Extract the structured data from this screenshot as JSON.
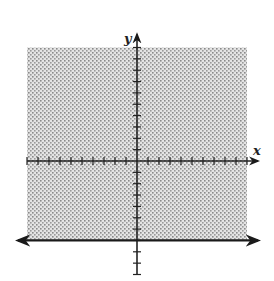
{
  "chart_data": {
    "type": "inequality-graph",
    "title": "",
    "xlabel": "x",
    "ylabel": "y",
    "xlim": [
      -10,
      10
    ],
    "ylim": [
      -10,
      10
    ],
    "tick_step": 1,
    "grid": false,
    "boundary": {
      "equation": "y = -7",
      "style": "solid",
      "direction": "horizontal"
    },
    "inequality": "y ≥ -7",
    "shaded_region": {
      "x_range": [
        -10,
        10
      ],
      "y_range": [
        -7,
        10
      ],
      "side": "above"
    },
    "colors": {
      "shade": "#b8b8b8",
      "axis": "#222222",
      "boundary": "#1a1a1a"
    }
  },
  "labels": {
    "x_axis": "x",
    "y_axis": "y"
  }
}
